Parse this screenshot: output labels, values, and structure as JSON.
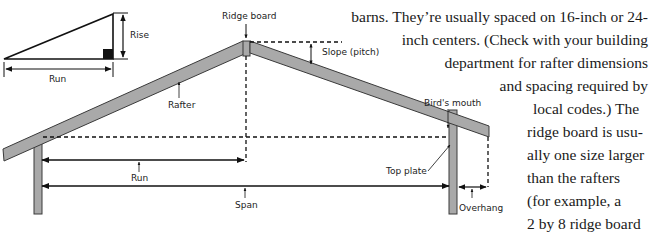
{
  "diagram": {
    "inset": {
      "rise_label": "Rise",
      "run_label": "Run"
    },
    "labels": {
      "ridge_board": "Ridge board",
      "slope": "Slope (pitch)",
      "rafter": "Rafter",
      "birds_mouth": "Bird's mouth",
      "top_plate": "Top plate",
      "run": "Run",
      "span": "Span",
      "overhang": "Overhang"
    },
    "colors": {
      "lumber_fill": "#a9a9a9",
      "lumber_stroke": "#3a3a3a",
      "line": "#111111"
    }
  },
  "text": {
    "lines": [
      "barns. They’re usually spaced on 16-inch or 24-",
      "inch centers. (Check with your building",
      "department for rafter dimensions",
      "and spacing required by",
      "local codes.) The",
      "ridge board is usu-",
      "ally one size larger",
      "than the rafters",
      "(for example, a",
      "2 by 8 ridge board",
      "for 2 by 6 rafters)."
    ]
  }
}
